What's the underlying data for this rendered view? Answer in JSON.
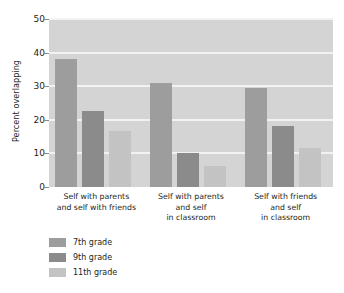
{
  "chart_data": {
    "type": "bar",
    "title": "",
    "subtitle": "",
    "xlabel": "",
    "ylabel": "Percent overlapping",
    "ylim": [
      0,
      50
    ],
    "yticks": [
      0,
      10,
      20,
      30,
      40,
      50
    ],
    "ytick_labels": [
      "0",
      "10",
      "20",
      "30",
      "40",
      "50"
    ],
    "grid": true,
    "grid_axis": "y",
    "legend_position": "below-left",
    "categories": [
      "Self with parents\nand self with friends",
      "Self with parents\nand self\nin classroom",
      "Self with friends\nand self\nin classroom"
    ],
    "series": [
      {
        "name": "7th grade",
        "values": [
          38.0,
          31.0,
          29.5
        ],
        "color": "#9d9d9d"
      },
      {
        "name": "9th grade",
        "values": [
          22.5,
          10.2,
          18.3
        ],
        "color": "#8b8b8b"
      },
      {
        "name": "11th grade",
        "values": [
          16.8,
          6.3,
          11.5
        ],
        "color": "#c3c3c3"
      }
    ],
    "plot_background": "#d4d4d4",
    "gridline_color": "#f2f2f2",
    "figure_background": "#ffffff",
    "text_color": "#231f20"
  },
  "legend": {
    "items": [
      {
        "label": "7th grade"
      },
      {
        "label": "9th grade"
      },
      {
        "label": "11th grade"
      }
    ]
  }
}
